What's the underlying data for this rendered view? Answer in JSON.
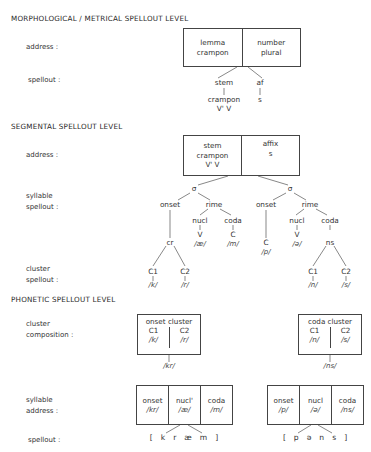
{
  "morphological": {
    "heading": "MORPHOLOGICAL / METRICAL  SPELLOUT LEVEL",
    "labels": {
      "address": "address :",
      "spellout": "spellout :"
    },
    "address_box": [
      {
        "line1": "lemma",
        "line2": "crampon"
      },
      {
        "line1": "number",
        "line2": "plural"
      }
    ],
    "spellout": {
      "stem": {
        "top": "stem",
        "bottom": "crampon",
        "metrical": "V'  V"
      },
      "affix": {
        "top": "af",
        "bottom": "s"
      }
    }
  },
  "segmental": {
    "heading": "SEGMENTAL  SPELLOUT LEVEL",
    "labels": {
      "address": "address :",
      "syllable_line1": "syllable",
      "syllable_line2": "spellout :",
      "cluster_line1": "cluster",
      "cluster_line2": "spellout :"
    },
    "address_box": [
      {
        "line1": "stem",
        "line2": "crampon",
        "line3": "V'  V"
      },
      {
        "line1": "affix",
        "line2": "s"
      }
    ],
    "syllables": [
      {
        "sigma": "σ",
        "onset": "onset",
        "rime": "rime",
        "nucleus": "nucl",
        "coda": "coda",
        "onset_cluster": "cr",
        "nucleus_type": "V",
        "nucleus_phon": "/æ/",
        "coda_type": "C",
        "coda_phon": "/m/",
        "cluster_c1": "C1",
        "cluster_c2": "C2",
        "cluster_c1_phon": "/k/",
        "cluster_c2_phon": "/r/"
      },
      {
        "sigma": "σ",
        "onset": "onset",
        "rime": "rime",
        "nucleus": "nucl",
        "coda": "coda",
        "onset_type": "C",
        "onset_phon": "/p/",
        "nucleus_type": "V",
        "nucleus_phon": "/ə/",
        "coda_cluster": "ns",
        "cluster_c1": "C1",
        "cluster_c2": "C2",
        "cluster_c1_phon": "/n/",
        "cluster_c2_phon": "/s/"
      }
    ]
  },
  "phonetic": {
    "heading": "PHONETIC  SPELLOUT LEVEL",
    "labels": {
      "cluster_line1": "cluster",
      "cluster_line2": "composition :",
      "syllable_line1": "syllable",
      "syllable_line2": "address :",
      "spellout": "spellout :"
    },
    "onset_cluster": {
      "title": "onset cluster",
      "c1": "C1",
      "c1_phon": "/k/",
      "c2": "C2",
      "c2_phon": "/r/",
      "result": "/kr/"
    },
    "coda_cluster": {
      "title": "coda cluster",
      "c1": "C1",
      "c1_phon": "/n/",
      "c2": "C2",
      "c2_phon": "/s/",
      "result": "/ns/"
    },
    "syllable1": [
      {
        "label": "onset",
        "phon": "/kr/"
      },
      {
        "label": "nucl'",
        "phon": "/æ/"
      },
      {
        "label": "coda",
        "phon": "/m/"
      }
    ],
    "syllable2": [
      {
        "label": "onset",
        "phon": "/p/"
      },
      {
        "label": "nucl",
        "phon": "/ə/"
      },
      {
        "label": "coda",
        "phon": "/ns/"
      }
    ],
    "spellout1": [
      "[",
      "k",
      "r",
      "æ",
      "m",
      "]"
    ],
    "spellout2": [
      "[",
      "p",
      "ə",
      "n",
      "s",
      "]"
    ]
  }
}
